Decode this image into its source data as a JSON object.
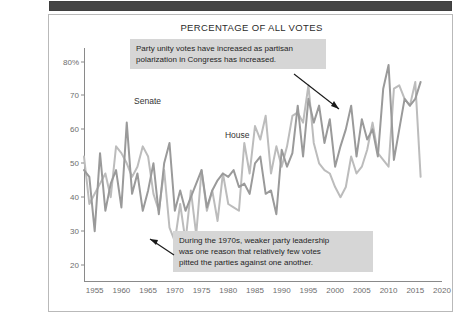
{
  "figure": {
    "title": "PERCENTAGE OF ALL VOTES",
    "top_band_color": "#454545",
    "border_color": "#b9b9b9",
    "background": "#ffffff"
  },
  "axes": {
    "y_ticks": [
      "80%",
      "70",
      "60",
      "50",
      "40",
      "30",
      "20"
    ],
    "y_values": [
      80,
      70,
      60,
      50,
      40,
      30,
      20
    ],
    "x_ticks": [
      "1955",
      "1960",
      "1965",
      "1970",
      "1975",
      "1980",
      "1985",
      "1990",
      "1995",
      "2000",
      "2005",
      "2010",
      "2015",
      "2020"
    ],
    "x_values": [
      1955,
      1960,
      1965,
      1970,
      1975,
      1980,
      1985,
      1990,
      1995,
      2000,
      2005,
      2010,
      2015,
      2020
    ]
  },
  "series_labels": {
    "senate": "Senate",
    "house": "House"
  },
  "annotations": [
    {
      "name": "annotation-polarization",
      "text": "Party unity votes have increased as partisan\npolarization in Congress has increased."
    },
    {
      "name": "annotation-1970s",
      "text": "During the 1970s, weaker party leadership\nwas one reason that relatively few votes\npitted the parties against one another."
    }
  ],
  "chart_data": {
    "type": "line",
    "title": "PERCENTAGE OF ALL VOTES",
    "xlabel": "",
    "ylabel": "",
    "xlim": [
      1953,
      2020
    ],
    "ylim": [
      15,
      84
    ],
    "grid": false,
    "legend": "inline-labels",
    "colors": {
      "senate": "#9a9a9a",
      "house": "#bcbcbc"
    },
    "x": [
      1953,
      1954,
      1955,
      1956,
      1957,
      1958,
      1959,
      1960,
      1961,
      1962,
      1963,
      1964,
      1965,
      1966,
      1967,
      1968,
      1969,
      1970,
      1971,
      1972,
      1973,
      1974,
      1975,
      1976,
      1977,
      1978,
      1979,
      1980,
      1981,
      1982,
      1983,
      1984,
      1985,
      1986,
      1987,
      1988,
      1989,
      1990,
      1991,
      1992,
      1993,
      1994,
      1995,
      1996,
      1997,
      1998,
      1999,
      2000,
      2001,
      2002,
      2003,
      2004,
      2005,
      2006,
      2007,
      2008,
      2009,
      2010,
      2011,
      2012,
      2013,
      2014,
      2015,
      2016
    ],
    "series": [
      {
        "name": "Senate",
        "values": [
          48,
          46,
          30,
          53,
          36,
          44,
          48,
          37,
          62,
          41,
          47,
          36,
          42,
          50,
          35,
          50,
          56,
          36,
          42,
          36,
          40,
          44,
          48,
          37,
          42,
          45,
          47,
          46,
          48,
          43,
          44,
          41,
          50,
          52,
          41,
          42,
          35,
          54,
          49,
          53,
          67,
          52,
          69,
          62,
          67,
          56,
          63,
          49,
          55,
          60,
          67,
          52,
          63,
          57,
          60,
          52,
          72,
          79,
          51,
          60,
          69,
          67,
          69,
          74
        ]
      },
      {
        "name": "House",
        "values": [
          52,
          38,
          41,
          44,
          47,
          40,
          55,
          53,
          50,
          46,
          49,
          55,
          52,
          41,
          36,
          48,
          31,
          27,
          38,
          27,
          42,
          29,
          48,
          36,
          42,
          33,
          47,
          38,
          37,
          36,
          56,
          47,
          61,
          57,
          64,
          47,
          55,
          49,
          55,
          64,
          65,
          62,
          73,
          56,
          50,
          48,
          47,
          43,
          40,
          43,
          52,
          47,
          49,
          54,
          62,
          53,
          51,
          49,
          72,
          73,
          69,
          67,
          74,
          46
        ]
      }
    ]
  }
}
